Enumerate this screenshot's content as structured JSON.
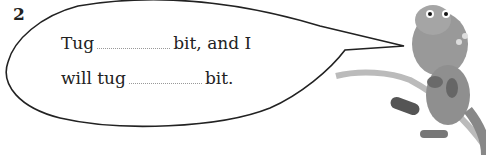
{
  "exercise": {
    "number": "2",
    "line1": {
      "before": "Tug",
      "after": "bit, and I"
    },
    "line2": {
      "before": "will tug",
      "after": "bit."
    }
  },
  "illustration": "dinosaur-pulling-rope"
}
